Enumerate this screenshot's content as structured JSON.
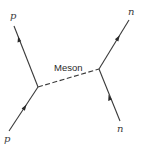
{
  "diagram": {
    "type": "feynman",
    "colors": {
      "line": "#3a3a3a",
      "text": "#2a2a2a",
      "background": "#ffffff"
    },
    "vertices": [
      {
        "id": "v1",
        "x": 38,
        "y": 87
      },
      {
        "id": "v2",
        "x": 99,
        "y": 69
      }
    ],
    "propagator": {
      "label": "Meson",
      "from": "v1",
      "to": "v2",
      "style": "dashed"
    },
    "external_lines": [
      {
        "id": "p_in",
        "label": "p",
        "vertex": "v1",
        "end": {
          "x": 9,
          "y": 131
        },
        "direction": "incoming"
      },
      {
        "id": "p_out",
        "label": "p",
        "vertex": "v1",
        "end": {
          "x": 14,
          "y": 26
        },
        "direction": "outgoing"
      },
      {
        "id": "n_in",
        "label": "n",
        "vertex": "v2",
        "end": {
          "x": 120,
          "y": 121
        },
        "direction": "incoming"
      },
      {
        "id": "n_out",
        "label": "n",
        "vertex": "v2",
        "end": {
          "x": 129,
          "y": 20
        },
        "direction": "outgoing"
      }
    ],
    "labels": {
      "top_left": "p",
      "bottom_left": "p",
      "top_right": "n",
      "bottom_right": "n",
      "meson": "Meson"
    }
  }
}
